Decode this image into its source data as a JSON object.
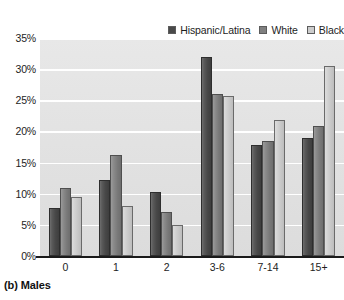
{
  "caption": "(b) Males",
  "legend": {
    "position": "top-right",
    "entries": [
      {
        "label": "Hispanic/Latina",
        "swatch_name": "legend-swatch-hispanic-latina",
        "color": "#4a4a4a"
      },
      {
        "label": "White",
        "swatch_name": "legend-swatch-white",
        "color": "#808080"
      },
      {
        "label": "Black",
        "swatch_name": "legend-swatch-black",
        "color": "#cccccc"
      }
    ]
  },
  "axes": {
    "y_ticks": [
      "0%",
      "5%",
      "10%",
      "15%",
      "20%",
      "25%",
      "30%",
      "35%"
    ],
    "x_ticks": [
      "0",
      "1",
      "2",
      "3-6",
      "7-14",
      "15+"
    ]
  },
  "chart_data": {
    "type": "bar",
    "title": "(b) Males",
    "xlabel": "",
    "ylabel": "",
    "ylim": [
      0,
      35
    ],
    "ytick_step": 5,
    "grid": true,
    "legend_position": "top-right",
    "categories": [
      "0",
      "1",
      "2",
      "3-6",
      "7-14",
      "15+"
    ],
    "series": [
      {
        "name": "Hispanic/Latina",
        "color": "#4a4a4a",
        "values": [
          7.7,
          12.2,
          10.2,
          32.0,
          17.9,
          19.0
        ]
      },
      {
        "name": "White",
        "color": "#808080",
        "values": [
          11.0,
          16.2,
          7.0,
          26.0,
          18.5,
          20.9
        ]
      },
      {
        "name": "Black",
        "color": "#cccccc",
        "values": [
          9.5,
          8.1,
          5.0,
          25.7,
          21.8,
          30.5
        ]
      }
    ]
  }
}
